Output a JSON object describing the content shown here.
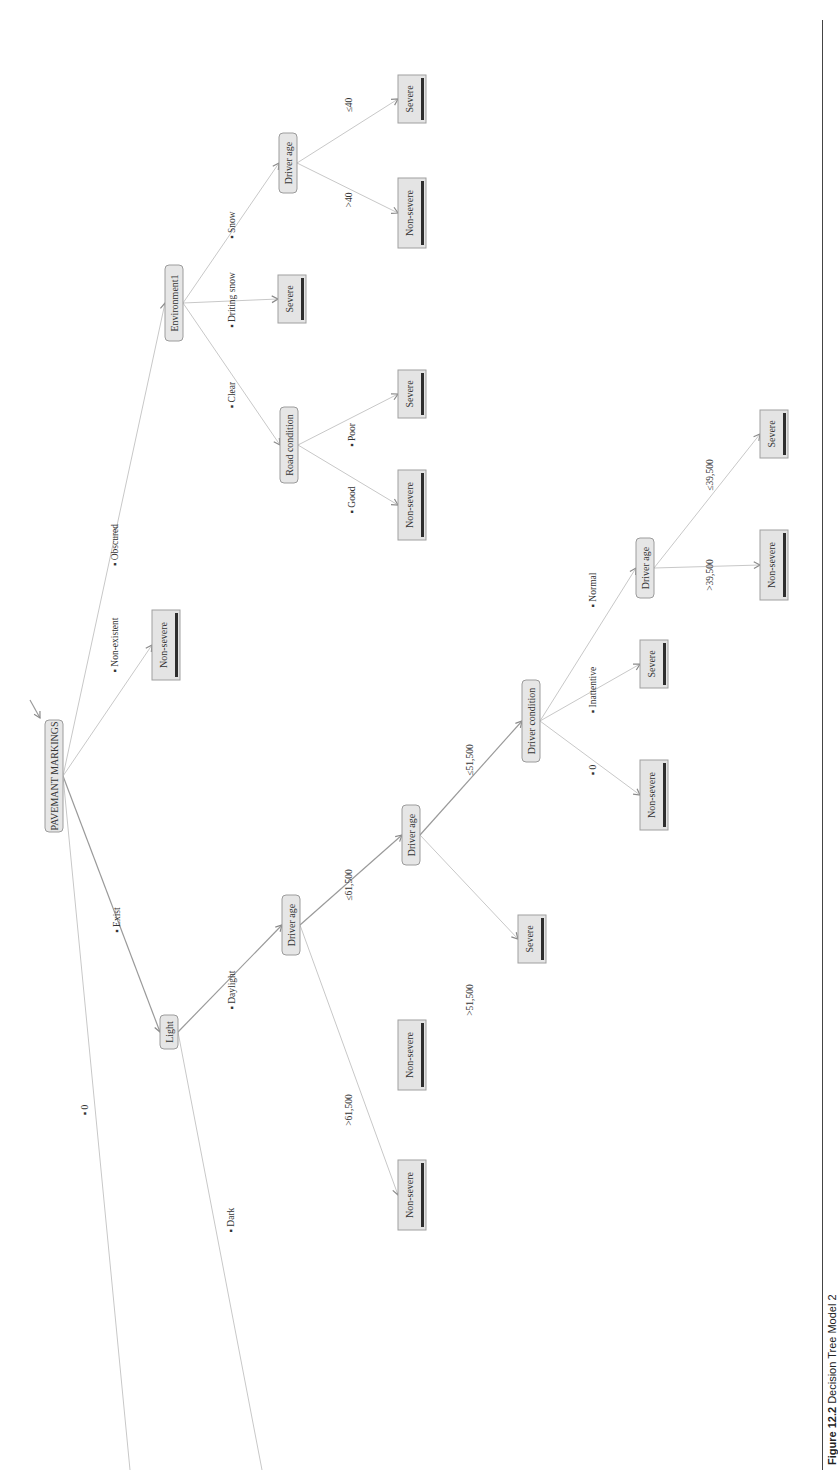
{
  "figure": {
    "caption_label": "Figure 12.2",
    "caption_text": "Decision Tree Model 2",
    "orientation": "rotated 90° counter-clockwise (text reads bottom-to-top)"
  },
  "colors": {
    "node_fill": "#e6e6e6",
    "node_border": "#9c9c9c",
    "leaf_bar": "#2e2e2e",
    "edge": "#c8c8c8"
  },
  "nodes": [
    {
      "id": "root",
      "label": "PAVEMANT MARKINGS",
      "type": "split",
      "x": 45,
      "y": 720,
      "w": 18,
      "h": 112
    },
    {
      "id": "light",
      "label": "Light",
      "type": "split",
      "x": 160,
      "y": 1015,
      "w": 18,
      "h": 34
    },
    {
      "id": "age1",
      "label": "Driver age",
      "type": "split",
      "x": 282,
      "y": 895,
      "w": 18,
      "h": 60
    },
    {
      "id": "age2",
      "label": "Driver age",
      "type": "split",
      "x": 402,
      "y": 805,
      "w": 18,
      "h": 60
    },
    {
      "id": "cond",
      "label": "Driver condition",
      "type": "split",
      "x": 522,
      "y": 680,
      "w": 18,
      "h": 82
    },
    {
      "id": "age3",
      "label": "Driver age",
      "type": "split",
      "x": 636,
      "y": 538,
      "w": 18,
      "h": 60
    },
    {
      "id": "env",
      "label": "Environment1",
      "type": "split",
      "x": 165,
      "y": 265,
      "w": 18,
      "h": 76
    },
    {
      "id": "road",
      "label": "Road condition",
      "type": "split",
      "x": 280,
      "y": 407,
      "w": 18,
      "h": 76
    },
    {
      "id": "age4",
      "label": "Driver age",
      "type": "split",
      "x": 279,
      "y": 133,
      "w": 18,
      "h": 60
    },
    {
      "id": "leaf_dark",
      "label": "Non-severe",
      "type": "leaf",
      "x": 398,
      "y": 1160,
      "w": 28,
      "h": 70
    },
    {
      "id": "leaf_gt615",
      "label": "Non-severe",
      "type": "leaf",
      "x": 398,
      "y": 1020,
      "w": 28,
      "h": 70
    },
    {
      "id": "leaf_gt515",
      "label": "Severe",
      "type": "leaf",
      "x": 518,
      "y": 915,
      "w": 28,
      "h": 48
    },
    {
      "id": "leaf_zero",
      "label": "Non-severe",
      "type": "leaf",
      "x": 640,
      "y": 760,
      "w": 28,
      "h": 70
    },
    {
      "id": "leaf_inatt",
      "label": "Severe",
      "type": "leaf",
      "x": 640,
      "y": 640,
      "w": 28,
      "h": 48
    },
    {
      "id": "leaf_gt395",
      "label": "Non-severe",
      "type": "leaf",
      "x": 760,
      "y": 530,
      "w": 28,
      "h": 70
    },
    {
      "id": "leaf_le395",
      "label": "Severe",
      "type": "leaf",
      "x": 760,
      "y": 410,
      "w": 28,
      "h": 48
    },
    {
      "id": "leaf_nonexist",
      "label": "Non-severe",
      "type": "leaf",
      "x": 152,
      "y": 610,
      "w": 28,
      "h": 70
    },
    {
      "id": "leaf_good",
      "label": "Non-severe",
      "type": "leaf",
      "x": 398,
      "y": 470,
      "w": 28,
      "h": 70
    },
    {
      "id": "leaf_poor",
      "label": "Severe",
      "type": "leaf",
      "x": 398,
      "y": 370,
      "w": 28,
      "h": 48
    },
    {
      "id": "leaf_drift",
      "label": "Severe",
      "type": "leaf",
      "x": 278,
      "y": 275,
      "w": 28,
      "h": 48
    },
    {
      "id": "leaf_gt40",
      "label": "Non-severe",
      "type": "leaf",
      "x": 398,
      "y": 178,
      "w": 28,
      "h": 70
    },
    {
      "id": "leaf_le40",
      "label": "Severe",
      "type": "leaf",
      "x": 398,
      "y": 75,
      "w": 28,
      "h": 48
    }
  ],
  "edges": [
    {
      "from": "root",
      "to": "light",
      "label": "▪ Exist",
      "lx": 120,
      "ly": 920,
      "strong": true
    },
    {
      "from": "root",
      "to": null,
      "tx": 130,
      "ty": 1470,
      "label": "▪ 0",
      "lx": 88,
      "ly": 1110,
      "strong": false
    },
    {
      "from": "root",
      "to": "leaf_nonexist",
      "label": "▪ Non-existent",
      "lx": 118,
      "ly": 645,
      "strong": false
    },
    {
      "from": "root",
      "to": "env",
      "label": "▪ Obscured",
      "lx": 118,
      "ly": 545,
      "strong": false
    },
    {
      "from": "light",
      "to": "age1",
      "label": "▪ Daylight",
      "lx": 235,
      "ly": 990,
      "strong": true
    },
    {
      "from": "light",
      "to": null,
      "tx": 262,
      "ty": 1470,
      "label": "▪ Dark",
      "lx": 234,
      "ly": 1220,
      "strong": false
    },
    {
      "from": "age1",
      "to": "age2",
      "label": "≤61,500",
      "lx": 352,
      "ly": 885,
      "strong": true
    },
    {
      "from": "age1",
      "to": "leaf_dark",
      "label": ">61,500",
      "lx": 352,
      "ly": 1110,
      "strong": false
    },
    {
      "from": "age2",
      "to": "cond",
      "label": "≤51,500",
      "lx": 473,
      "ly": 760,
      "strong": true
    },
    {
      "from": "age2",
      "to": "leaf_gt515",
      "label": ">51,500",
      "lx": 473,
      "ly": 1000,
      "strong": false
    },
    {
      "from": "cond",
      "to": "age3",
      "label": "▪ Normal",
      "lx": 596,
      "ly": 590,
      "strong": false
    },
    {
      "from": "cond",
      "to": "leaf_inatt",
      "label": "▪ Inattentive",
      "lx": 596,
      "ly": 690,
      "strong": false
    },
    {
      "from": "cond",
      "to": "leaf_zero",
      "label": "▪ 0",
      "lx": 596,
      "ly": 770,
      "strong": false
    },
    {
      "from": "age3",
      "to": "leaf_gt395",
      "label": ">39,500",
      "lx": 713,
      "ly": 575,
      "strong": false
    },
    {
      "from": "age3",
      "to": "leaf_le395",
      "label": "≤39,500",
      "lx": 713,
      "ly": 475,
      "strong": false
    },
    {
      "from": "env",
      "to": "road",
      "label": "▪ Clear",
      "lx": 235,
      "ly": 395,
      "strong": false
    },
    {
      "from": "env",
      "to": "leaf_drift",
      "label": "▪ Driting snow",
      "lx": 235,
      "ly": 300,
      "strong": false
    },
    {
      "from": "env",
      "to": "age4",
      "label": "▪ Snow",
      "lx": 235,
      "ly": 225,
      "strong": false
    },
    {
      "from": "road",
      "to": "leaf_good",
      "label": "▪ Good",
      "lx": 355,
      "ly": 500,
      "strong": false
    },
    {
      "from": "road",
      "to": "leaf_poor",
      "label": "▪ Poor",
      "lx": 355,
      "ly": 435,
      "strong": false
    },
    {
      "from": "age4",
      "to": "leaf_gt40",
      "label": ">40",
      "lx": 352,
      "ly": 200,
      "strong": false
    },
    {
      "from": "age4",
      "to": "leaf_le40",
      "label": "≤40",
      "lx": 352,
      "ly": 105,
      "strong": false
    }
  ],
  "root_incoming_arrow": {
    "x1": 30,
    "y1": 700,
    "x2": 40,
    "y2": 718
  }
}
